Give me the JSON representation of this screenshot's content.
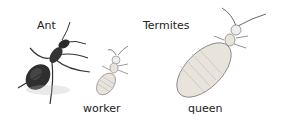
{
  "labels": {
    "ant": "Ant",
    "termites": "Termites",
    "worker": "worker",
    "queen": "queen"
  },
  "colors": {
    "ant_body": "#2a2a2a",
    "termite_body": "#e8e4dc",
    "outline": "#555555",
    "text": "#222222"
  }
}
